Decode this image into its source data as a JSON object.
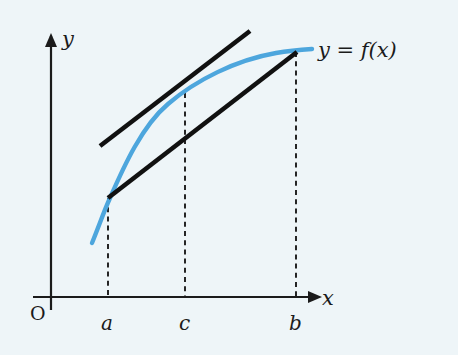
{
  "figure": {
    "kind": "mean-value-theorem-diagram",
    "background_color": "#eef5f8",
    "ink_color": "#1b1b1b",
    "curve_color": "#4da6dd",
    "labels": {
      "y_axis": "y",
      "x_axis": "x",
      "origin": "O",
      "curve": "y = f(x)",
      "tick_a": "a",
      "tick_c": "c",
      "tick_b": "b"
    }
  },
  "chart_data": {
    "type": "line",
    "title": "",
    "subtitle": "",
    "xlabel": "x",
    "ylabel": "y",
    "xlim": [
      0,
      458
    ],
    "ylim": [
      0,
      355
    ],
    "grid": false,
    "legend": false,
    "annotations": [
      {
        "name": "curve-label",
        "text": "y = f(x)",
        "x": 318,
        "y": 57,
        "font_size": 21,
        "italic": true
      },
      {
        "name": "origin-label",
        "text": "O",
        "x": 30,
        "y": 320,
        "font_size": 19,
        "italic": false
      },
      {
        "name": "y-axis-label",
        "text": "y",
        "x": 62,
        "y": 46,
        "font_size": 21,
        "italic": true
      },
      {
        "name": "x-axis-label",
        "text": "x",
        "x": 322,
        "y": 305,
        "font_size": 21,
        "italic": true
      },
      {
        "name": "tick-label-a",
        "text": "a",
        "x": 101,
        "y": 330,
        "font_size": 20,
        "italic": true
      },
      {
        "name": "tick-label-c",
        "text": "c",
        "x": 179,
        "y": 330,
        "font_size": 20,
        "italic": true
      },
      {
        "name": "tick-label-b",
        "text": "b",
        "x": 289,
        "y": 330,
        "font_size": 20,
        "italic": true
      }
    ],
    "axes": {
      "x_axis": {
        "x1": 33,
        "y1": 297,
        "x2": 308,
        "y2": 297,
        "arrow": "right"
      },
      "y_axis": {
        "x1": 51,
        "y1": 310,
        "x2": 51,
        "y2": 36,
        "arrow": "up"
      }
    },
    "series": [
      {
        "name": "f(x)",
        "role": "function-curve",
        "color": "#4da6dd",
        "width": 4.4,
        "path": "M 92 243 C 99 226 104 211 110 198 C 124 166 142 126 168 104 C 196 80 236 60 276 53 C 288 51 298 50 312 49"
      },
      {
        "name": "secant-ab",
        "role": "secant-line",
        "color": "#111111",
        "width": 4.6,
        "points": [
          [
            108,
            198
          ],
          [
            297,
            52
          ]
        ]
      },
      {
        "name": "tangent-c",
        "role": "tangent-line",
        "color": "#111111",
        "width": 4.6,
        "points": [
          [
            100,
            146
          ],
          [
            250,
            31
          ]
        ]
      }
    ],
    "drop_lines": [
      {
        "name": "drop-line-a",
        "x": 108,
        "y_top": 198,
        "y_bottom": 297
      },
      {
        "name": "drop-line-c",
        "x": 185,
        "y_top": 93,
        "y_bottom": 297
      },
      {
        "name": "drop-line-b",
        "x": 296,
        "y_top": 52,
        "y_bottom": 297
      }
    ]
  }
}
